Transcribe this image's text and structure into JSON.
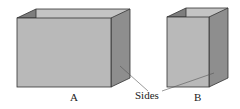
{
  "diagram": {
    "boxes": [
      {
        "id": "A",
        "label": "A",
        "front_color": "#b9b9b9",
        "side_color": "#8e8e8e",
        "top_color": "#9d9d9d",
        "inner_color": "#c4c4c4"
      },
      {
        "id": "B",
        "label": "B",
        "front_color": "#b9b9b9",
        "side_color": "#8e8e8e",
        "top_color": "#9d9d9d",
        "inner_color": "#c4c4c4"
      }
    ],
    "annotation": {
      "text": "Sides",
      "points_to": [
        "A side face",
        "B side face"
      ]
    },
    "colors": {
      "edge": "#333333",
      "leader": "#555555",
      "background": "#ffffff"
    }
  }
}
